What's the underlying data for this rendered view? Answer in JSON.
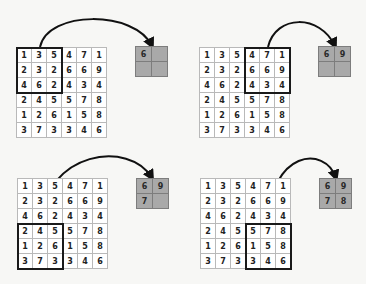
{
  "input_matrix": [
    [
      1,
      3,
      5,
      4,
      7,
      1
    ],
    [
      2,
      3,
      2,
      6,
      6,
      9
    ],
    [
      4,
      6,
      2,
      4,
      3,
      4
    ],
    [
      2,
      4,
      5,
      5,
      7,
      8
    ],
    [
      1,
      2,
      6,
      1,
      5,
      8
    ],
    [
      3,
      7,
      3,
      3,
      4,
      6
    ]
  ],
  "colors": {
    "grid_line": "#b9b9b9",
    "window_border": "#1a1a1a",
    "output_fill": "#a9a9a9",
    "output_line": "#7d7d7d",
    "arrow": "#111111"
  },
  "panels": [
    {
      "name": "step-1",
      "window": {
        "row": 0,
        "col": 0,
        "size": 3
      },
      "output": [
        [
          "6",
          ""
        ],
        [
          "",
          ""
        ]
      ]
    },
    {
      "name": "step-2",
      "window": {
        "row": 0,
        "col": 3,
        "size": 3
      },
      "output": [
        [
          "6",
          "9"
        ],
        [
          "",
          ""
        ]
      ]
    },
    {
      "name": "step-3",
      "window": {
        "row": 3,
        "col": 0,
        "size": 3
      },
      "output": [
        [
          "6",
          "9"
        ],
        [
          "7",
          ""
        ]
      ]
    },
    {
      "name": "step-4",
      "window": {
        "row": 3,
        "col": 3,
        "size": 3
      },
      "output": [
        [
          "6",
          "9"
        ],
        [
          "7",
          "8"
        ]
      ]
    }
  ]
}
